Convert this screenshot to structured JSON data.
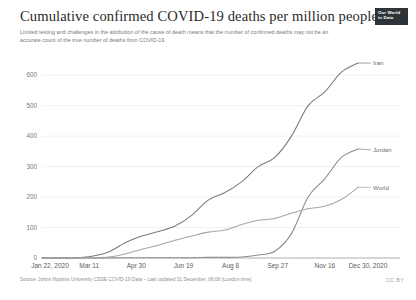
{
  "header": {
    "title": "Cumulative confirmed COVID-19 deaths per million people",
    "subtitle": "Limited testing and challenges in the attribution of the cause of death means that the number of confirmed deaths may not be an accurate count of the true number of deaths from COVID-19.",
    "logo_line1": "Our World",
    "logo_line2": "in Data"
  },
  "footer": {
    "source": "Source: Johns Hopkins University CSSE COVID-19 Data – Last updated 31 December, 06:06 (London time)",
    "license": "CC BY"
  },
  "chart_data": {
    "type": "line",
    "title": "Cumulative confirmed COVID-19 deaths per million people",
    "subtitle": "Limited testing and challenges in the attribution of the cause of death means that the number of confirmed deaths may not be an accurate count of the true number of deaths from COVID-19.",
    "xlabel": "",
    "ylabel": "",
    "grid": true,
    "legend_position": "inline-right-labels",
    "xlim": [
      "Jan 22, 2020",
      "Dec 30, 2020"
    ],
    "ylim": [
      0,
      650
    ],
    "yticks": [
      0,
      100,
      200,
      300,
      400,
      500,
      600
    ],
    "ytick_labels": [
      "0",
      "100",
      "200",
      "300",
      "400",
      "500",
      "600"
    ],
    "xticks": [
      "Jan 22, 2020",
      "Mar 11",
      "Apr 30",
      "Jun 19",
      "Aug 8",
      "Sep 27",
      "Nov 16",
      "Dec 30, 2020"
    ],
    "x": [
      "Jan 22",
      "Feb 11",
      "Mar 2",
      "Mar 11",
      "Mar 22",
      "Apr 10",
      "Apr 30",
      "May 20",
      "Jun 19",
      "Jul 9",
      "Jul 29",
      "Aug 8",
      "Aug 28",
      "Sep 17",
      "Sep 27",
      "Oct 17",
      "Nov 6",
      "Nov 16",
      "Dec 6",
      "Dec 30"
    ],
    "series": [
      {
        "name": "Iran",
        "color": "#7a7a7a",
        "label_x": "Dec 30, 2020",
        "label_y": 640,
        "values": [
          0,
          0,
          1,
          6,
          20,
          50,
          72,
          87,
          105,
          140,
          190,
          215,
          250,
          300,
          330,
          400,
          500,
          545,
          610,
          640
        ]
      },
      {
        "name": "Jordan",
        "color": "#8a8a8a",
        "label_x": "Dec 30, 2020",
        "label_y": 355,
        "values": [
          0,
          0,
          0,
          0,
          0,
          1,
          1,
          1,
          1,
          1,
          2,
          2,
          3,
          10,
          22,
          80,
          200,
          260,
          330,
          358
        ]
      },
      {
        "name": "World",
        "color": "#a6a6a6",
        "label_x": "Dec 30, 2020",
        "label_y": 232,
        "values": [
          0,
          0,
          0,
          1,
          3,
          13,
          29,
          42,
          58,
          72,
          85,
          92,
          110,
          124,
          130,
          147,
          162,
          170,
          192,
          232
        ]
      }
    ],
    "annotations": []
  }
}
